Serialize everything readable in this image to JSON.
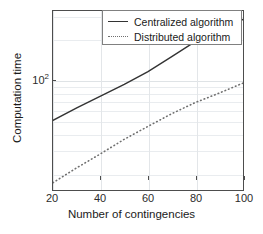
{
  "chart_data": {
    "type": "line",
    "title": "",
    "xlabel": "Number of contingencies",
    "ylabel": "Computation time",
    "xlim": [
      20,
      100
    ],
    "ylim": [
      15,
      330
    ],
    "yscale": "log",
    "xscale": "linear",
    "grid": true,
    "legend_position": "top-right",
    "xticks": [
      20,
      40,
      60,
      80,
      100
    ],
    "xticklabels": [
      "20",
      "40",
      "60",
      "80",
      "100"
    ],
    "yticks": [
      100
    ],
    "yticklabels": [
      "10",
      "2"
    ],
    "ytick_display": "10^2",
    "x": [
      20,
      30,
      40,
      50,
      60,
      70,
      80,
      90,
      100
    ],
    "series": [
      {
        "name": "Centralized algorithm",
        "style": "solid",
        "color": "#333333",
        "values": [
          50,
          62,
          76,
          93,
          116,
          150,
          195,
          240,
          285
        ]
      },
      {
        "name": "Distributed algorithm",
        "style": "dotted",
        "color": "#6f6f6f",
        "values": [
          17,
          22,
          28,
          36,
          45,
          56,
          68,
          80,
          95
        ]
      }
    ]
  },
  "legend": {
    "entries": [
      {
        "label": "Centralized algorithm",
        "icon": "solid-line-swatch"
      },
      {
        "label": "Distributed algorithm",
        "icon": "dotted-line-swatch"
      }
    ]
  },
  "axes": {
    "x_title": "Number of contingencies",
    "y_title": "Computation time",
    "x_tick_labels": [
      "20",
      "40",
      "60",
      "80",
      "100"
    ],
    "y_tick_base": "10",
    "y_tick_exp": "2"
  }
}
